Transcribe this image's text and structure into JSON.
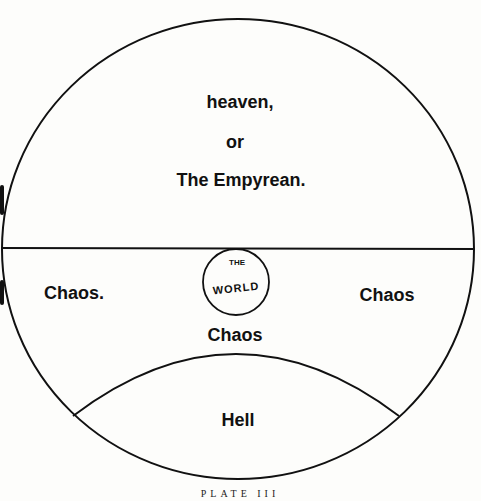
{
  "diagram": {
    "regions": {
      "heaven": {
        "line1": "heaven,",
        "line2": "or",
        "line3": "The Empyrean."
      },
      "chaos_left": "Chaos.",
      "chaos_right": "Chaos",
      "chaos_center": "Chaos",
      "world": {
        "top": "THE",
        "bottom": "WORLD"
      },
      "hell": "Hell"
    },
    "caption": "PLATE III",
    "colors": {
      "ink": "#111111",
      "paper": "#fdfdfb"
    }
  }
}
